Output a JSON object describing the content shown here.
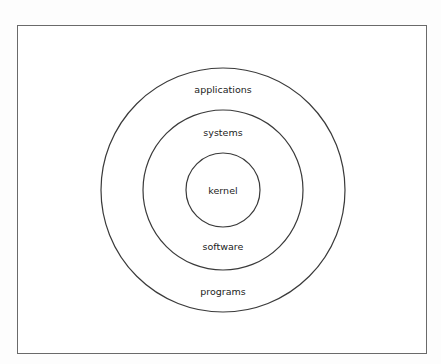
{
  "figure": {
    "type": "concentric-circles",
    "frame": {
      "border_color": "#6a6a6a"
    },
    "stroke_color": "#3a3a3a",
    "text_color": "#222222",
    "center": {
      "x": 223,
      "y": 190
    },
    "rings": [
      {
        "name": "outer",
        "radius": 122,
        "top_label": "applications",
        "bottom_label": "programs"
      },
      {
        "name": "middle",
        "radius": 80,
        "top_label": "systems",
        "bottom_label": "software"
      },
      {
        "name": "inner",
        "radius": 37,
        "center_label": "kernel"
      }
    ]
  }
}
